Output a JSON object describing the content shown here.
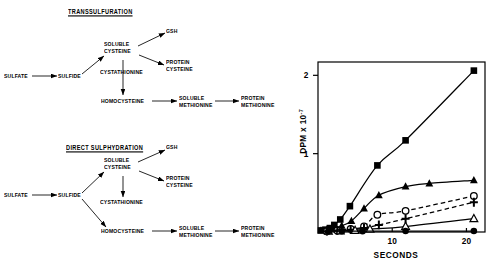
{
  "figure": {
    "panels": [
      "pathway-diagrams",
      "kinetics-chart"
    ]
  },
  "diagrams": [
    {
      "id": "transsulfuration",
      "title": "TRANSSULFURATION",
      "nodes": {
        "sulfate": "SULFATE",
        "sulfide": "SULFIDE",
        "soluble_cysteine_l1": "SOLUBLE",
        "soluble_cysteine_l2": "CYSTEINE",
        "gsh": "GSH",
        "protein_cysteine_l1": "PROTEIN",
        "protein_cysteine_l2": "CYSTEINE",
        "cystathionine": "CYSTATHIONINE",
        "homocysteine": "HOMOCYSTEINE",
        "soluble_methionine_l1": "SOLUBLE",
        "soluble_methionine_l2": "METHIONINE",
        "protein_methionine_l1": "PROTEIN",
        "protein_methionine_l2": "METHIONINE"
      }
    },
    {
      "id": "direct-sulphydration",
      "title": "DIRECT  SULPHYDRATION",
      "nodes": {
        "sulfate": "SULFATE",
        "sulfide": "SULFIDE",
        "soluble_cysteine_l1": "SOLUBLE",
        "soluble_cysteine_l2": "CYSTEINE",
        "gsh": "GSH",
        "protein_cysteine_l1": "PROTEIN",
        "protein_cysteine_l2": "CYSTEINE",
        "cystathionine": "CYSTATHIONINE",
        "homocysteine": "HOMOCYSTEINE",
        "soluble_methionine_l1": "SOLUBLE",
        "soluble_methionine_l2": "METHIONINE",
        "protein_methionine_l1": "PROTEIN",
        "protein_methionine_l2": "METHIONINE"
      }
    }
  ],
  "chart_data": {
    "type": "line",
    "title": "",
    "xlabel": "SECONDS",
    "ylabel": "DPM x 10",
    "ylabel_exponent": "-7",
    "xlim": [
      0,
      22.5
    ],
    "ylim": [
      0,
      2.17
    ],
    "xticks": [
      10,
      20
    ],
    "xtick_labels": [
      "10",
      "20"
    ],
    "yticks": [
      1,
      2
    ],
    "ytick_labels": [
      "1",
      "2"
    ],
    "grid": false,
    "legend": "none",
    "series": [
      {
        "name": "filled-square",
        "marker": "filled-square",
        "line": "solid",
        "x": [
          0.4,
          1.0,
          1.6,
          2.2,
          3.0,
          4.3,
          8.0,
          11.8,
          21.0
        ],
        "y": [
          0.02,
          0.03,
          0.05,
          0.09,
          0.16,
          0.33,
          0.85,
          1.17,
          2.06
        ]
      },
      {
        "name": "filled-triangle",
        "marker": "filled-triangle",
        "line": "solid",
        "x": [
          0.4,
          1.2,
          2.2,
          3.2,
          4.5,
          6.2,
          8.2,
          11.8,
          15.0,
          21.0
        ],
        "y": [
          0.02,
          0.03,
          0.05,
          0.08,
          0.14,
          0.3,
          0.47,
          0.58,
          0.62,
          0.66
        ]
      },
      {
        "name": "open-circle",
        "marker": "open-circle",
        "line": "dashed",
        "x": [
          1.2,
          2.6,
          4.4,
          6.2,
          8.0,
          11.8,
          21.0
        ],
        "y": [
          0.01,
          0.02,
          0.04,
          0.07,
          0.22,
          0.27,
          0.46
        ]
      },
      {
        "name": "plus-cross",
        "marker": "plus-cross",
        "line": "dashed",
        "x": [
          1.2,
          2.6,
          4.4,
          6.2,
          8.2,
          11.8,
          21.0
        ],
        "y": [
          0.01,
          0.02,
          0.03,
          0.05,
          0.09,
          0.17,
          0.38
        ]
      },
      {
        "name": "open-triangle",
        "marker": "open-triangle",
        "line": "solid",
        "x": [
          1.4,
          3.0,
          5.0,
          7.0,
          11.8,
          21.0
        ],
        "y": [
          0.01,
          0.015,
          0.02,
          0.035,
          0.07,
          0.17
        ]
      },
      {
        "name": "filled-circle",
        "marker": "filled-circle",
        "line": "solid",
        "x": [
          1.4,
          3.2,
          6.0,
          11.8,
          21.0
        ],
        "y": [
          0.01,
          0.01,
          0.01,
          0.012,
          0.012
        ]
      }
    ]
  }
}
